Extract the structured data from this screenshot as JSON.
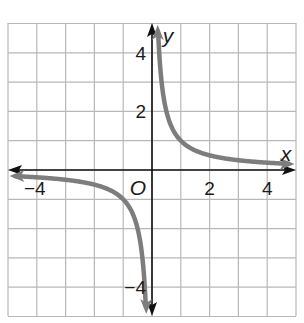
{
  "chart_data": {
    "type": "line",
    "title": "",
    "function": "y = 1/x",
    "xlabel": "x",
    "ylabel": "y",
    "origin_label": "O",
    "xlim": [
      -5,
      5
    ],
    "ylim": [
      -5,
      5
    ],
    "grid": true,
    "grid_step": 1,
    "x_ticks": [
      {
        "value": -4,
        "label": "−4"
      },
      {
        "value": 2,
        "label": "2"
      },
      {
        "value": 4,
        "label": "4"
      }
    ],
    "y_ticks": [
      {
        "value": 4,
        "label": "4"
      },
      {
        "value": 2,
        "label": "2"
      },
      {
        "value": -4,
        "label": "−4"
      }
    ],
    "series": [
      {
        "name": "branch-positive",
        "x": [
          0.2,
          0.25,
          0.5,
          1,
          2,
          3,
          4,
          4.8
        ],
        "y": [
          5,
          4,
          2,
          1,
          0.5,
          0.333,
          0.25,
          0.208
        ]
      },
      {
        "name": "branch-negative",
        "x": [
          -4.8,
          -4,
          -3,
          -2,
          -1,
          -0.5,
          -0.25,
          -0.2
        ],
        "y": [
          -0.208,
          -0.25,
          -0.333,
          -0.5,
          -1,
          -2,
          -4,
          -5
        ]
      }
    ],
    "colors": {
      "curve": "#7d7d7d",
      "axes": "#111111",
      "grid": "#b8b8b8"
    }
  }
}
